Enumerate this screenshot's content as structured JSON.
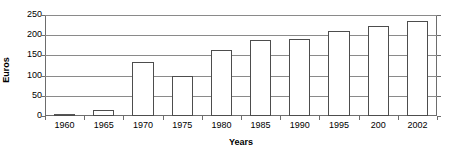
{
  "chart_data": {
    "type": "bar",
    "title": "",
    "subtitle": "",
    "xlabel": "Years",
    "ylabel": "Euros",
    "categories": [
      "1960",
      "1965",
      "1970",
      "1975",
      "1980",
      "1985",
      "1990",
      "1995",
      "200",
      "2002"
    ],
    "values": [
      3,
      16,
      133,
      100,
      163,
      188,
      191,
      210,
      224,
      236
    ],
    "series": [
      {
        "name": "Euros",
        "values": [
          3,
          16,
          133,
          100,
          163,
          188,
          191,
          210,
          224,
          236
        ]
      }
    ],
    "ylim": [
      0,
      250
    ],
    "ytick_values": [
      0,
      50,
      100,
      150,
      200,
      250
    ],
    "ytick_labels": [
      "0",
      "50",
      "100",
      "150",
      "200",
      "250"
    ],
    "xlim_categories": 10,
    "grid": true,
    "grid_axis": "y",
    "legend": false,
    "legend_position": "none",
    "bar_fill_color": "#ffffff",
    "bar_border_color": "#4d4d4d",
    "gridline_color": "#8a8a8a",
    "axis_color": "#6d6d6d",
    "text_color": "#000000",
    "background_color": "#ffffff",
    "annotations": []
  }
}
